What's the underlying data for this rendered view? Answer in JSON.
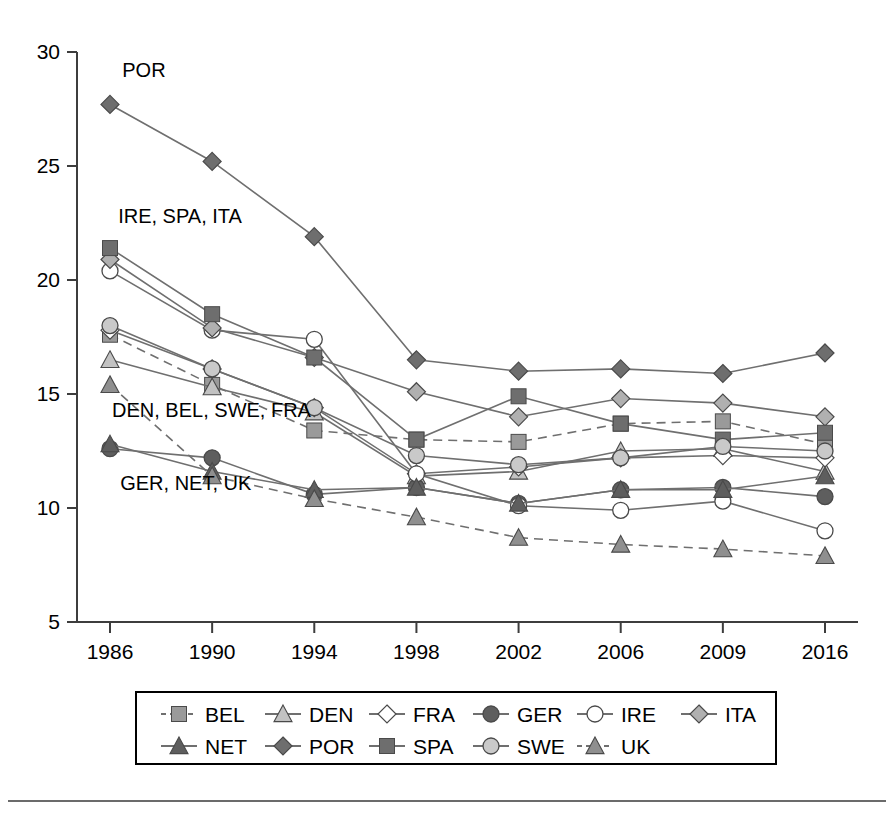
{
  "chart_data": {
    "type": "line",
    "title": "",
    "xlabel": "",
    "ylabel": "",
    "x": [
      "1986",
      "1990",
      "1994",
      "1998",
      "2002",
      "2006",
      "2009",
      "2016"
    ],
    "xlim": [
      0,
      7
    ],
    "ylim": [
      5,
      30
    ],
    "yticks": [
      "5",
      "10",
      "15",
      "20",
      "25",
      "30"
    ],
    "grid": false,
    "legend_position": "bottom",
    "series": [
      {
        "name": "BEL",
        "marker": "square",
        "color": "#9a9a9a",
        "line_style": "dashed",
        "values": [
          17.6,
          15.4,
          13.4,
          13.0,
          12.9,
          13.7,
          13.8,
          12.8
        ]
      },
      {
        "name": "DEN",
        "marker": "triangle",
        "color": "#c2c2c2",
        "line_style": "solid",
        "values": [
          16.5,
          15.3,
          14.2,
          11.4,
          11.6,
          12.5,
          12.6,
          11.6
        ]
      },
      {
        "name": "FRA",
        "marker": "diamond-open",
        "color": "#ffffff",
        "line_style": "solid",
        "values": [
          17.8,
          16.1,
          14.4,
          11.5,
          11.8,
          12.2,
          12.3,
          12.2
        ]
      },
      {
        "name": "GER",
        "marker": "circle",
        "color": "#5e5e5e",
        "line_style": "solid",
        "values": [
          12.6,
          12.2,
          10.6,
          10.9,
          10.2,
          10.8,
          10.9,
          10.5
        ]
      },
      {
        "name": "IRE",
        "marker": "circle-open",
        "color": "#ffffff",
        "line_style": "solid",
        "values": [
          20.4,
          17.8,
          17.4,
          11.5,
          10.1,
          9.9,
          10.3,
          9.0
        ]
      },
      {
        "name": "ITA",
        "marker": "diamond",
        "color": "#b0b0b0",
        "line_style": "solid",
        "values": [
          20.9,
          17.9,
          16.6,
          15.1,
          14.0,
          14.8,
          14.6,
          14.0
        ]
      },
      {
        "name": "NET",
        "marker": "triangle",
        "color": "#5e5e5e",
        "line_style": "solid",
        "values": [
          12.8,
          11.6,
          10.8,
          10.9,
          10.2,
          10.8,
          10.8,
          11.4
        ]
      },
      {
        "name": "POR",
        "marker": "diamond",
        "color": "#6e6e6e",
        "line_style": "solid",
        "values": [
          27.7,
          25.2,
          21.9,
          16.5,
          16.0,
          16.1,
          15.9,
          16.8
        ]
      },
      {
        "name": "SPA",
        "marker": "square",
        "color": "#6e6e6e",
        "line_style": "solid",
        "values": [
          21.4,
          18.5,
          16.6,
          13.0,
          14.9,
          13.7,
          13.0,
          13.3
        ]
      },
      {
        "name": "SWE",
        "marker": "circle",
        "color": "#c9c9c9",
        "line_style": "solid",
        "values": [
          18.0,
          16.1,
          14.4,
          12.3,
          11.9,
          12.2,
          12.7,
          12.5
        ]
      },
      {
        "name": "UK",
        "marker": "triangle",
        "color": "#8f8f8f",
        "line_style": "dashed",
        "values": [
          15.4,
          11.4,
          10.4,
          9.6,
          8.7,
          8.4,
          8.2,
          7.9
        ]
      }
    ],
    "annotations": [
      {
        "text": "POR",
        "x_value": 0.12,
        "y_value": 28.9
      },
      {
        "text": "IRE, SPA, ITA",
        "x_value": 0.08,
        "y_value": 22.5
      },
      {
        "text": "DEN, BEL, SWE, FRA",
        "x_value": 0.02,
        "y_value": 14.0
      },
      {
        "text": "GER, NET, UK",
        "x_value": 0.1,
        "y_value": 10.8
      }
    ]
  },
  "legend": {
    "row1": [
      "BEL",
      "DEN",
      "FRA",
      "GER",
      "IRE",
      "ITA"
    ],
    "row2": [
      "NET",
      "POR",
      "SPA",
      "SWE",
      "UK"
    ]
  }
}
